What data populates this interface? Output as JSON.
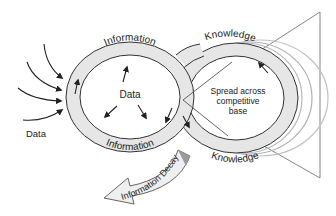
{
  "diagram": {
    "left_loop": {
      "ring_top_label": "Information",
      "ring_bottom_label": "Information",
      "center_label": "Data"
    },
    "right_loop": {
      "ring_top_label": "Knowledge",
      "ring_bottom_label": "Knowledge",
      "center_label_line1": "Spread across",
      "center_label_line2": "competitive",
      "center_label_line3": "base"
    },
    "input_label": "Data",
    "decay_label": "Information Decay",
    "colors": {
      "ring_fill": "#e6e6e6",
      "stroke": "#333333",
      "ghost_ring": "#b0b0b0",
      "triangle": "#777777",
      "decay_arrow_fill": "#efefef",
      "decay_shadow": "#9a9a9a"
    }
  }
}
